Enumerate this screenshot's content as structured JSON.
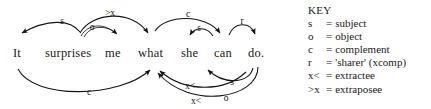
{
  "figure": {
    "type": "dependency-diagram",
    "sentence": {
      "text": "It surprises me what she can do.",
      "words": [
        {
          "id": "it",
          "text": "It",
          "x": 13
        },
        {
          "id": "surprises",
          "text": "surprises",
          "x": 45
        },
        {
          "id": "me",
          "text": "me",
          "x": 105
        },
        {
          "id": "what",
          "text": "what",
          "x": 138
        },
        {
          "id": "she",
          "text": "she",
          "x": 181
        },
        {
          "id": "can",
          "text": "can",
          "x": 214
        },
        {
          "id": "do",
          "text": "do.",
          "x": 248
        }
      ]
    },
    "arcs": [
      {
        "id": "arc-s-surprises-it",
        "label": "s",
        "from": "surprises",
        "to": "it",
        "side": "above",
        "label_x": 62,
        "label_y": 24
      },
      {
        "id": "arc-o-surprises-me",
        "label": "o",
        "from": "surprises",
        "to": "me",
        "side": "above",
        "label_x": 92,
        "label_y": 30
      },
      {
        "id": "arc-extrapose-what",
        "label": ">x",
        "from": "surprises",
        "to": "what",
        "side": "above",
        "label_x": 110,
        "label_y": 16
      },
      {
        "id": "arc-c-what-can",
        "label": "c",
        "from": "what",
        "to": "can",
        "side": "above",
        "label_x": 188,
        "label_y": 17
      },
      {
        "id": "arc-s-can-she",
        "label": "s",
        "from": "can",
        "to": "she",
        "side": "above",
        "label_x": 196,
        "label_y": 31
      },
      {
        "id": "arc-r-can-do",
        "label": "r",
        "from": "can",
        "to": "do",
        "side": "above",
        "label_x": 240,
        "label_y": 22
      },
      {
        "id": "arc-c-it-what",
        "label": "c",
        "from": "it",
        "to": "what",
        "side": "below",
        "label_x": 89,
        "label_y": 94
      },
      {
        "id": "arc-s-do-she",
        "label": "s",
        "from": "do",
        "to": "she",
        "side": "below",
        "label_x": 229,
        "label_y": 85
      },
      {
        "id": "arc-extract-what-1",
        "label": "x<",
        "from": "do",
        "to": "what",
        "side": "below",
        "label_x": 190,
        "label_y": 88
      },
      {
        "id": "arc-extract-o-what",
        "label": "x<",
        "from": "do",
        "to": "what",
        "side": "below",
        "label_x": 196,
        "label_y": 103
      },
      {
        "id": "arc-o-do",
        "label": "o",
        "from": "do",
        "to": "what",
        "side": "below",
        "label_x": 225,
        "label_y": 100
      }
    ]
  },
  "key": {
    "title": "KEY",
    "entries": [
      {
        "symbol": "s",
        "eq": "=",
        "meaning": "subject"
      },
      {
        "symbol": "o",
        "eq": "=",
        "meaning": "object"
      },
      {
        "symbol": "c",
        "eq": "=",
        "meaning": "complement"
      },
      {
        "symbol": "r",
        "eq": "=",
        "meaning": "'sharer' (xcomp)"
      },
      {
        "symbol": "x<",
        "eq": "=",
        "meaning": "extractee"
      },
      {
        "symbol": ">x",
        "eq": "=",
        "meaning": "extraposee"
      }
    ]
  },
  "colors": {
    "ink": "#141414",
    "background": "#ffffff"
  }
}
